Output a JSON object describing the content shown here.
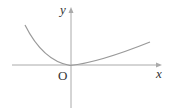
{
  "diagram": {
    "labels": {
      "y_axis": "y",
      "x_axis": "x",
      "origin": "O"
    },
    "colors": {
      "axis": "#999999",
      "curve": "#999999",
      "text": "#333333"
    }
  }
}
